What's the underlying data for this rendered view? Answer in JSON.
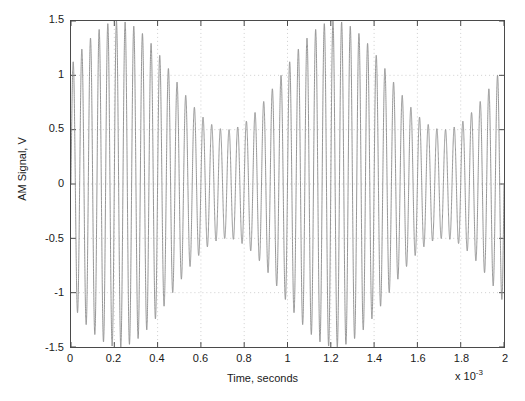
{
  "chart_data": {
    "type": "line",
    "title": "",
    "xlabel": "Time, seconds",
    "ylabel": "AM Signal, V",
    "x_exponent_prefix": "x 10",
    "x_exponent_power": "-3",
    "xlim": [
      0,
      0.002
    ],
    "ylim": [
      -1.5,
      1.5
    ],
    "grid": true,
    "grid_style": "dotted",
    "line_color": "#8a8a8a",
    "axis_color": "#4a4a4a",
    "xticks": [
      0,
      0.0002,
      0.0004,
      0.0006,
      0.0008,
      0.001,
      0.0012,
      0.0014,
      0.0016,
      0.0018,
      0.002
    ],
    "xticklabels": [
      "0",
      "0.2",
      "0.4",
      "0.6",
      "0.8",
      "1",
      "1.2",
      "1.4",
      "1.6",
      "1.8",
      "2"
    ],
    "yticks": [
      -1.5,
      -1,
      -0.5,
      0,
      0.5,
      1,
      1.5
    ],
    "yticklabels": [
      "-1.5",
      "-1",
      "-0.5",
      "0",
      "0.5",
      "1",
      "1.5"
    ],
    "series": [
      {
        "name": "AM Signal",
        "description": "Amplitude modulated carrier, clipped at +/-1.5 V",
        "carrier_frequency_hz": 25000,
        "modulation_frequency_hz": 1000,
        "carrier_amplitude_v": 1.0,
        "modulation_index": 0.5,
        "envelope_peaks_v": [
          1.5,
          1.5
        ],
        "envelope_minima_v": [
          0.5,
          0.5
        ],
        "envelope_peak_times_s": [
          0.00022,
          0.00125
        ],
        "envelope_min_times_s": [
          0.00075,
          0.00175
        ],
        "samples_note": "Waveform reconstructed as A*(1 + m*sin(2*pi*fm*t + phi))*sin(2*pi*fc*t), clipped to ylim"
      }
    ]
  }
}
